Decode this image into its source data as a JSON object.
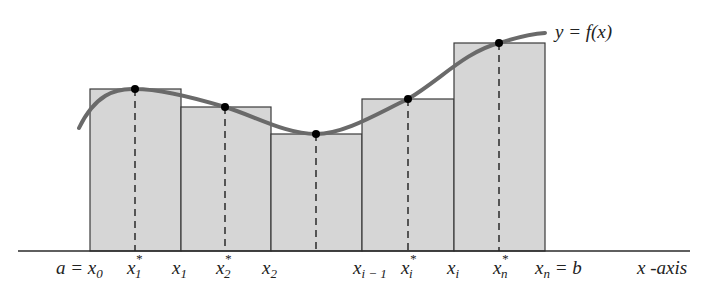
{
  "diagram": {
    "type": "riemann-sum-illustration",
    "curve_label": "y = f(x)",
    "axis_label": "x -axis",
    "colors": {
      "rectangle_fill": "#d6d6d6",
      "rectangle_stroke": "#3a3a3a",
      "curve": "#6a6a6a",
      "points": "#000000",
      "axis": "#2a2a2a"
    },
    "rectangles": [
      {
        "left": "a = x0",
        "sample": "x1*",
        "right": "x1"
      },
      {
        "left": "x1",
        "sample": "x2*",
        "right": "x2"
      },
      {
        "left": "x2",
        "sample": "",
        "right": "x_{i-1}"
      },
      {
        "left": "x_{i-1}",
        "sample": "xi*",
        "right": "xi"
      },
      {
        "left": "xi",
        "sample": "xn*",
        "right": "xn = b"
      }
    ],
    "tick_labels": [
      {
        "id": "a-x0",
        "main": "a = x",
        "sub": "0",
        "sup": ""
      },
      {
        "id": "x1-star",
        "main": "x",
        "sub": "1",
        "sup": "*"
      },
      {
        "id": "x1",
        "main": "x",
        "sub": "1",
        "sup": ""
      },
      {
        "id": "x2-star",
        "main": "x",
        "sub": "2",
        "sup": "*"
      },
      {
        "id": "x2",
        "main": "x",
        "sub": "2",
        "sup": ""
      },
      {
        "id": "xi-minus-1",
        "main": "x",
        "sub": "i − 1",
        "sup": ""
      },
      {
        "id": "xi-star",
        "main": "x",
        "sub": "i",
        "sup": "*"
      },
      {
        "id": "xi",
        "main": "x",
        "sub": "i",
        "sup": ""
      },
      {
        "id": "xn-star",
        "main": "x",
        "sub": "n",
        "sup": "*"
      },
      {
        "id": "xn-b",
        "main": "x",
        "sub": "n",
        "sup": "",
        "suffix": " = b"
      }
    ]
  }
}
